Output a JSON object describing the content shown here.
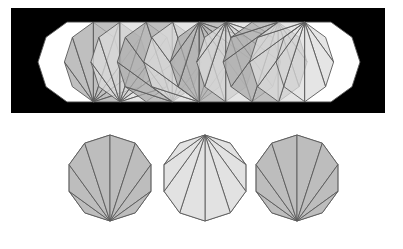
{
  "figure": {
    "title": "",
    "background": "#ffffff",
    "stroke": "#5a5a5a",
    "fills": {
      "dark": "#a9a9a9",
      "mid": "#bdbdbd",
      "light": "#dcdcdc",
      "hull": "#ffffff"
    },
    "panel": {
      "x": 11,
      "y": 8,
      "w": 374,
      "h": 105,
      "color": "#000000"
    },
    "strip": {
      "sides": 10,
      "rotation_deg": 0,
      "cy": 62,
      "r": 42,
      "centers_x": [
        80,
        106.4,
        132.9,
        159.3,
        185.8,
        212.2,
        238.7,
        265.1,
        291.6,
        318
      ],
      "fan_apex_index": [
        null,
        3,
        3,
        2,
        2,
        7,
        7,
        8,
        8,
        null
      ],
      "fan_shade": [
        "hull",
        "dark",
        "light",
        "dark",
        "light",
        "dark",
        "light",
        "dark",
        "light",
        "hull"
      ]
    },
    "bottom_row": {
      "sides": 10,
      "rotation_deg": -90,
      "cy": 178,
      "r": 43,
      "items": [
        {
          "name": "decagon-fan-bottom-apex",
          "cx": 110,
          "apex_index": 5,
          "fill": "#bdbdbd"
        },
        {
          "name": "decagon-fan-top-apex",
          "cx": 205,
          "apex_index": 0,
          "fill": "#e2e2e2"
        },
        {
          "name": "decagon-fan-bottom-apex-2",
          "cx": 297,
          "apex_index": 5,
          "fill": "#bdbdbd"
        }
      ]
    }
  }
}
